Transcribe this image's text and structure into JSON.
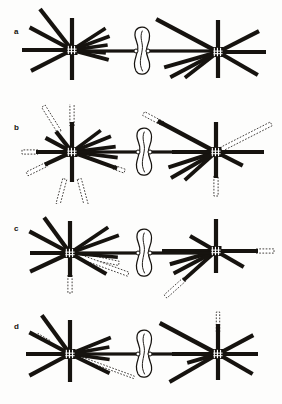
{
  "figure": {
    "background_color": "#fdfdfc",
    "ink_color": "#16130f",
    "paper_color": "#ffffff",
    "width": 282,
    "height": 404
  },
  "panels": [
    {
      "label": "a",
      "label_x": 14,
      "label_y": 28,
      "top": 4,
      "height": 100,
      "description": "Two spindle poles with solid astral and kinetochore microtubules; no dashed microtubules",
      "poles": [
        {
          "name": "left-pole",
          "cx": 72,
          "cy": 46
        },
        {
          "name": "right-pole",
          "cx": 218,
          "cy": 48
        }
      ],
      "chromosome": {
        "cx": 142,
        "cy": 47
      },
      "solid_microtubules": [
        {
          "pole": "left",
          "angle": 180,
          "length": 50,
          "width": 4.2
        },
        {
          "pole": "left",
          "angle": 90,
          "length": 32,
          "width": 4.2
        },
        {
          "pole": "left",
          "angle": 270,
          "length": 30,
          "width": 4.2
        },
        {
          "pole": "left",
          "angle": 207,
          "length": 46,
          "width": 4.2
        },
        {
          "pole": "left",
          "angle": 152,
          "length": 48,
          "width": 4.2
        },
        {
          "pole": "left",
          "angle": 128,
          "length": 52,
          "width": 4.2
        },
        {
          "pole": "left",
          "angle": 345,
          "length": 38,
          "width": 4.0
        },
        {
          "pole": "left",
          "angle": 355,
          "length": 34,
          "width": 3.6
        },
        {
          "pole": "left",
          "angle": 8,
          "length": 36,
          "width": 3.6
        },
        {
          "pole": "left",
          "angle": 20,
          "length": 40,
          "width": 3.8
        },
        {
          "pole": "left",
          "angle": 33,
          "length": 40,
          "width": 3.6
        },
        {
          "pole": "right",
          "angle": 0,
          "length": 48,
          "width": 4.2
        },
        {
          "pole": "right",
          "angle": 90,
          "length": 32,
          "width": 4.2
        },
        {
          "pole": "right",
          "angle": 270,
          "length": 26,
          "width": 4.2
        },
        {
          "pole": "right",
          "angle": 330,
          "length": 46,
          "width": 4.2
        },
        {
          "pole": "right",
          "angle": 27,
          "length": 46,
          "width": 4.2
        },
        {
          "pole": "right",
          "angle": 152,
          "length": 70,
          "width": 4.4
        },
        {
          "pole": "right",
          "angle": 196,
          "length": 56,
          "width": 4.0
        },
        {
          "pole": "right",
          "angle": 208,
          "length": 54,
          "width": 4.0
        },
        {
          "pole": "right",
          "angle": 218,
          "length": 42,
          "width": 3.8
        }
      ],
      "dashed_microtubules": []
    },
    {
      "label": "b",
      "label_x": 14,
      "label_y": 124,
      "top": 104,
      "height": 100,
      "description": "Many dashed (outlined) microtubules extending beyond solid ones at both poles",
      "poles": [
        {
          "name": "left-pole",
          "cx": 72,
          "cy": 48
        },
        {
          "name": "right-pole",
          "cx": 216,
          "cy": 48
        }
      ],
      "chromosome": {
        "cx": 144,
        "cy": 48
      },
      "solid_microtubules": [
        {
          "pole": "left",
          "angle": 180,
          "length": 36,
          "width": 4.2
        },
        {
          "pole": "left",
          "angle": 90,
          "length": 30,
          "width": 4.2
        },
        {
          "pole": "left",
          "angle": 270,
          "length": 30,
          "width": 4.2
        },
        {
          "pole": "left",
          "angle": 205,
          "length": 30,
          "width": 4.2
        },
        {
          "pole": "left",
          "angle": 152,
          "length": 30,
          "width": 4.2
        },
        {
          "pole": "left",
          "angle": 128,
          "length": 26,
          "width": 4.2
        },
        {
          "pole": "left",
          "angle": 340,
          "length": 48,
          "width": 4.0
        },
        {
          "pole": "left",
          "angle": 353,
          "length": 46,
          "width": 3.6
        },
        {
          "pole": "left",
          "angle": 7,
          "length": 44,
          "width": 3.6
        },
        {
          "pole": "left",
          "angle": 22,
          "length": 42,
          "width": 3.8
        },
        {
          "pole": "left",
          "angle": 37,
          "length": 36,
          "width": 3.6
        },
        {
          "pole": "right",
          "angle": 0,
          "length": 48,
          "width": 4.2
        },
        {
          "pole": "right",
          "angle": 90,
          "length": 30,
          "width": 4.2
        },
        {
          "pole": "right",
          "angle": 270,
          "length": 26,
          "width": 4.2
        },
        {
          "pole": "right",
          "angle": 333,
          "length": 30,
          "width": 4.2
        },
        {
          "pole": "right",
          "angle": 152,
          "length": 66,
          "width": 4.4
        },
        {
          "pole": "right",
          "angle": 180,
          "length": 44,
          "width": 4.0
        },
        {
          "pole": "right",
          "angle": 198,
          "length": 50,
          "width": 4.0
        },
        {
          "pole": "right",
          "angle": 210,
          "length": 52,
          "width": 4.0
        },
        {
          "pole": "right",
          "angle": 222,
          "length": 42,
          "width": 3.8
        }
      ],
      "dashed_microtubules": [
        {
          "pole": "left",
          "angle": 90,
          "start": 26,
          "length": 24,
          "width": 4.2
        },
        {
          "pole": "left",
          "angle": 122,
          "start": 24,
          "length": 30,
          "width": 4.2
        },
        {
          "pole": "left",
          "angle": 180,
          "start": 34,
          "length": 16,
          "width": 4.2
        },
        {
          "pole": "left",
          "angle": 206,
          "start": 28,
          "length": 22,
          "width": 4.2
        },
        {
          "pole": "left",
          "angle": 255,
          "start": 28,
          "length": 26,
          "width": 4.2
        },
        {
          "pole": "left",
          "angle": 285,
          "start": 28,
          "length": 32,
          "width": 4.2
        },
        {
          "pole": "left",
          "angle": 340,
          "start": 44,
          "length": 12,
          "width": 4.0
        },
        {
          "pole": "right",
          "angle": 152,
          "start": 60,
          "length": 22,
          "width": 4.2
        },
        {
          "pole": "right",
          "angle": 27,
          "start": 6,
          "length": 56,
          "width": 4.2
        },
        {
          "pole": "right",
          "angle": 270,
          "start": 24,
          "length": 20,
          "width": 4.2
        }
      ]
    },
    {
      "label": "c",
      "label_x": 14,
      "label_y": 225,
      "top": 205,
      "height": 100,
      "description": "Few dashed microtubules; mostly solid spindle fibers converging on the chromosome",
      "poles": [
        {
          "name": "left-pole",
          "cx": 70,
          "cy": 48
        },
        {
          "name": "right-pole",
          "cx": 216,
          "cy": 46
        }
      ],
      "chromosome": {
        "cx": 144,
        "cy": 48
      },
      "solid_microtubules": [
        {
          "pole": "left",
          "angle": 180,
          "length": 40,
          "width": 4.2
        },
        {
          "pole": "left",
          "angle": 90,
          "length": 32,
          "width": 4.2
        },
        {
          "pole": "left",
          "angle": 270,
          "length": 24,
          "width": 4.2
        },
        {
          "pole": "left",
          "angle": 205,
          "length": 44,
          "width": 4.2
        },
        {
          "pole": "left",
          "angle": 152,
          "length": 46,
          "width": 4.2
        },
        {
          "pole": "left",
          "angle": 126,
          "length": 44,
          "width": 4.2
        },
        {
          "pole": "left",
          "angle": 330,
          "length": 42,
          "width": 4.0
        },
        {
          "pole": "left",
          "angle": 355,
          "length": 48,
          "width": 3.6
        },
        {
          "pole": "left",
          "angle": 20,
          "length": 52,
          "width": 3.8
        },
        {
          "pole": "left",
          "angle": 34,
          "length": 46,
          "width": 3.8
        },
        {
          "pole": "right",
          "angle": 0,
          "length": 42,
          "width": 4.2
        },
        {
          "pole": "right",
          "angle": 90,
          "length": 32,
          "width": 4.2
        },
        {
          "pole": "right",
          "angle": 270,
          "length": 22,
          "width": 4.2
        },
        {
          "pole": "right",
          "angle": 330,
          "length": 32,
          "width": 4.2
        },
        {
          "pole": "right",
          "angle": 150,
          "length": 30,
          "width": 4.2
        },
        {
          "pole": "right",
          "angle": 180,
          "length": 54,
          "width": 4.0
        },
        {
          "pole": "right",
          "angle": 196,
          "length": 48,
          "width": 4.0
        },
        {
          "pole": "right",
          "angle": 208,
          "length": 48,
          "width": 4.0
        },
        {
          "pole": "right",
          "angle": 222,
          "length": 44,
          "width": 3.8
        }
      ],
      "dashed_microtubules": [
        {
          "pole": "left",
          "angle": 348,
          "start": 6,
          "length": 44,
          "width": 4.2
        },
        {
          "pole": "left",
          "angle": 340,
          "start": 6,
          "length": 56,
          "width": 4.2
        },
        {
          "pole": "left",
          "angle": 270,
          "start": 22,
          "length": 18,
          "width": 4.2
        },
        {
          "pole": "right",
          "angle": 0,
          "start": 40,
          "length": 18,
          "width": 4.2
        },
        {
          "pole": "right",
          "angle": 222,
          "start": 42,
          "length": 26,
          "width": 4.2
        }
      ]
    },
    {
      "label": "d",
      "label_x": 14,
      "label_y": 323,
      "top": 303,
      "height": 100,
      "description": "Mostly solid microtubules with a thin dashed probe pointing from left pole toward the chromosome",
      "poles": [
        {
          "name": "left-pole",
          "cx": 70,
          "cy": 51
        },
        {
          "name": "right-pole",
          "cx": 218,
          "cy": 51
        }
      ],
      "chromosome": {
        "cx": 144,
        "cy": 51
      },
      "solid_microtubules": [
        {
          "pole": "left",
          "angle": 180,
          "length": 44,
          "width": 4.2
        },
        {
          "pole": "left",
          "angle": 90,
          "length": 34,
          "width": 4.2
        },
        {
          "pole": "left",
          "angle": 270,
          "length": 28,
          "width": 4.2
        },
        {
          "pole": "left",
          "angle": 208,
          "length": 46,
          "width": 4.2
        },
        {
          "pole": "left",
          "angle": 152,
          "length": 46,
          "width": 4.2
        },
        {
          "pole": "left",
          "angle": 126,
          "length": 48,
          "width": 4.2
        },
        {
          "pole": "left",
          "angle": 334,
          "length": 44,
          "width": 4.0
        },
        {
          "pole": "left",
          "angle": 352,
          "length": 40,
          "width": 3.6
        },
        {
          "pole": "left",
          "angle": 10,
          "length": 40,
          "width": 3.6
        },
        {
          "pole": "left",
          "angle": 22,
          "length": 44,
          "width": 3.8
        },
        {
          "pole": "right",
          "angle": 0,
          "length": 40,
          "width": 4.2
        },
        {
          "pole": "right",
          "angle": 90,
          "length": 30,
          "width": 4.2
        },
        {
          "pole": "right",
          "angle": 270,
          "length": 26,
          "width": 4.2
        },
        {
          "pole": "right",
          "angle": 330,
          "length": 40,
          "width": 4.2
        },
        {
          "pole": "right",
          "angle": 28,
          "length": 40,
          "width": 4.2
        },
        {
          "pole": "right",
          "angle": 152,
          "length": 66,
          "width": 4.4
        },
        {
          "pole": "right",
          "angle": 180,
          "length": 46,
          "width": 4.0
        },
        {
          "pole": "right",
          "angle": 196,
          "length": 32,
          "width": 4.0
        },
        {
          "pole": "right",
          "angle": 210,
          "length": 56,
          "width": 4.0
        }
      ],
      "dashed_microtubules": [
        {
          "pole": "left",
          "angle": 340,
          "start": 6,
          "length": 62,
          "width": 2.6
        },
        {
          "pole": "left",
          "angle": 150,
          "start": 24,
          "length": 14,
          "width": 3.4
        },
        {
          "pole": "right",
          "angle": 90,
          "start": 22,
          "length": 20,
          "width": 3.4
        }
      ]
    }
  ],
  "legend_keys": {
    "solid_microtubule": "solid-black-microtubule",
    "dashed_microtubule": "dashed-outline-microtubule",
    "centrosome": "centriole-pair",
    "chromosome": "condensed-chromosome"
  }
}
